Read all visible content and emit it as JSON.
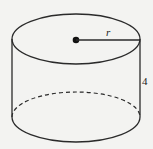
{
  "diagram": {
    "shape": "cylinder",
    "labels": {
      "radius": "r",
      "height": "4"
    },
    "colors": {
      "stroke": "#2a2a2a",
      "background": "#f3f3f1"
    }
  }
}
